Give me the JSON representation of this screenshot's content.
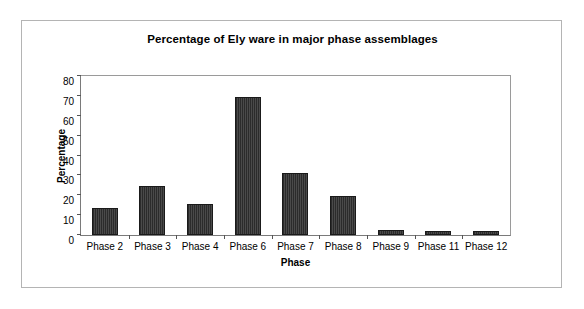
{
  "chart_data": {
    "type": "bar",
    "title": "Percentage of Ely ware in major phase assemblages",
    "xlabel": "Phase",
    "ylabel": "Percentage",
    "categories": [
      "Phase 2",
      "Phase 3",
      "Phase 4",
      "Phase 6",
      "Phase 7",
      "Phase 8",
      "Phase 9",
      "Phase 11",
      "Phase 12"
    ],
    "values": [
      13.6,
      24.5,
      15.5,
      69.3,
      31.2,
      19.8,
      2.6,
      2.2,
      2.2
    ],
    "ylim": [
      0,
      80
    ],
    "yticks": [
      0,
      10,
      20,
      30,
      40,
      50,
      60,
      70,
      80
    ],
    "ytick_labels": [
      "0",
      "10",
      "20",
      "30",
      "40",
      "50",
      "60",
      "70",
      "80"
    ],
    "grid": false,
    "legend": false,
    "legend_position": "none",
    "bar_color": "#333333",
    "bar_edge_color": "#1a1a1a",
    "axis_color": "#555555",
    "frame_color": "#b4b4b4",
    "background": "#ffffff"
  }
}
